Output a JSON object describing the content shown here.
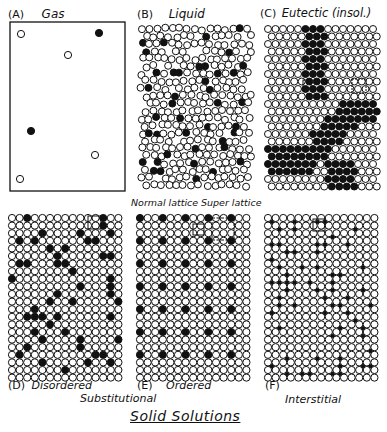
{
  "figure": {
    "panels": [
      {
        "id": "A",
        "letter": "(A)",
        "name": "Gas"
      },
      {
        "id": "B",
        "letter": "(B)",
        "name": "Liquid"
      },
      {
        "id": "C",
        "letter": "(C)",
        "name": "Eutectic (insol.)"
      },
      {
        "id": "D",
        "letter": "(D)",
        "name": "Disordered"
      },
      {
        "id": "E",
        "letter": "(E)",
        "name": "Ordered"
      },
      {
        "id": "F",
        "letter": "(F)",
        "name": "Interstitial"
      }
    ],
    "annotations": {
      "normal_lattice": "Normal lattice",
      "super_lattice": "Super lattice",
      "group_label": "Substitutional",
      "footer_title": "Solid Solutions"
    },
    "colors": {
      "ink": "#111111",
      "background": "#ffffff"
    }
  }
}
